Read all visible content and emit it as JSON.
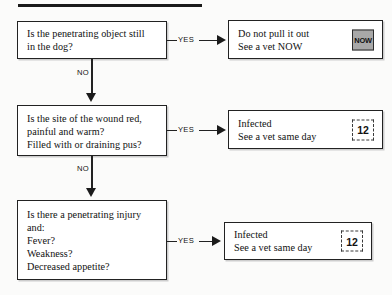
{
  "page": {
    "has_top_rule": true,
    "background_color": "#fbfbfa",
    "line_color": "#222222"
  },
  "flow": {
    "type": "decision-flowchart",
    "yes_label": "YES",
    "no_label": "NO",
    "questions": [
      {
        "id": "q1",
        "text": "Is the penetrating object still\nin the dog?",
        "yes_target": "o1",
        "no_target": "q2"
      },
      {
        "id": "q2",
        "text": "Is the site of the wound red,\npainful and warm?\nFilled with or draining pus?",
        "yes_target": "o2",
        "no_target": "q3"
      },
      {
        "id": "q3",
        "text": "Is there a penetrating injury\nand:\nFever?\nWeakness?\nDecreased appetite?",
        "yes_target": "o3",
        "no_target": null
      }
    ],
    "outcomes": [
      {
        "id": "o1",
        "text": "Do not pull it out\nSee a vet NOW",
        "badge": {
          "name": "now-badge",
          "label": "NOW",
          "style": "filled-square"
        }
      },
      {
        "id": "o2",
        "text": "Infected\nSee a vet same day",
        "badge": {
          "name": "twelve-hour-badge",
          "label": "12",
          "style": "dashed-square"
        }
      },
      {
        "id": "o3",
        "text": "Infected\nSee a vet same day",
        "badge": {
          "name": "twelve-hour-badge",
          "label": "12",
          "style": "dashed-square"
        }
      }
    ]
  }
}
